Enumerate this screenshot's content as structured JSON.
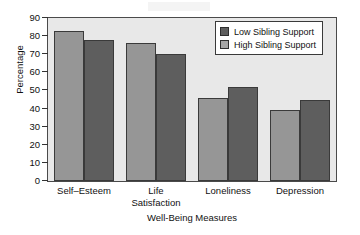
{
  "chart_data": {
    "type": "bar",
    "title": "",
    "xlabel": "Well-Being Measures",
    "ylabel": "Percentage",
    "ylim": [
      0,
      90
    ],
    "yticks": [
      0,
      10,
      20,
      30,
      40,
      50,
      60,
      70,
      80,
      90
    ],
    "grid": false,
    "legend_position": "top-right",
    "categories": [
      "Self–Esteem",
      "Life\nSatisfaction",
      "Loneliness",
      "Depression"
    ],
    "series": [
      {
        "name": "Low Sibling Support",
        "color": "#5e5e5e",
        "values": [
          83,
          76,
          52,
          45
        ]
      },
      {
        "name": "High Sibling Support",
        "color": "#969696",
        "values": [
          78,
          70,
          46,
          39
        ]
      }
    ],
    "bar_render_order": [
      {
        "group": 0,
        "series": "High Sibling Support",
        "value": 83
      },
      {
        "group": 0,
        "series": "Low Sibling Support",
        "value": 78
      },
      {
        "group": 1,
        "series": "High Sibling Support",
        "value": 76
      },
      {
        "group": 1,
        "series": "Low Sibling Support",
        "value": 70
      },
      {
        "group": 2,
        "series": "High Sibling Support",
        "value": 46
      },
      {
        "group": 2,
        "series": "Low Sibling Support",
        "value": 52
      },
      {
        "group": 3,
        "series": "High Sibling Support",
        "value": 39
      },
      {
        "group": 3,
        "series": "Low Sibling Support",
        "value": 45
      }
    ]
  },
  "legend": {
    "items": [
      {
        "label": "Low Sibling Support",
        "swatch": "low"
      },
      {
        "label": "High Sibling Support",
        "swatch": "high"
      }
    ]
  },
  "artifact": {
    "text": ""
  }
}
